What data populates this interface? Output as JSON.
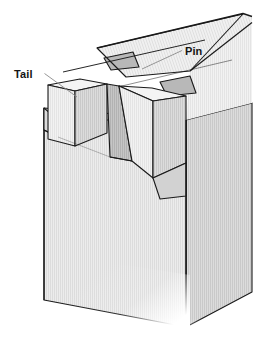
{
  "figure": {
    "name": "dovetail-joint-illustration",
    "background_color": "#ffffff",
    "line_color": "#1a1a1a",
    "labels": [
      {
        "id": "tail",
        "text": "Tail",
        "x": 14,
        "y": 78,
        "leader": {
          "x1": 44.5,
          "y1": 73.5,
          "x2": 77,
          "y2": 97
        }
      },
      {
        "id": "pin",
        "text": "Pin",
        "x": 185,
        "y": 55,
        "leader": {
          "x1": 182,
          "y1": 50.5,
          "x2": 142,
          "y2": 69
        }
      }
    ],
    "surfaces": {
      "top_face": "#f0f0f0",
      "front_face": "#e9e9e9",
      "side_face": "#dadada",
      "socket_shadow": "#bdbdbd",
      "socket_deep": "#cfcfcf",
      "tail_front": "#ededed",
      "grain_color": "#c9c9c9"
    },
    "geometry_notes": {
      "projection": "isometric-ish oblique",
      "tail_count": 2,
      "pin_count": 2,
      "grain_direction": "vertical on front face, oblique on top face"
    }
  }
}
